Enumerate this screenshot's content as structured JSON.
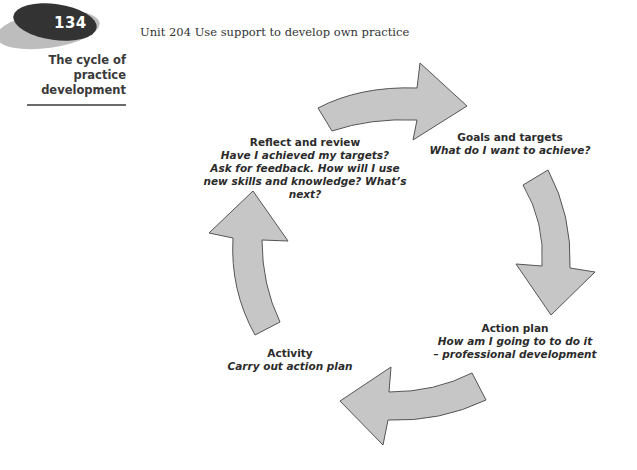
{
  "page": {
    "number": "134",
    "running_head": "Unit 204  Use support to develop own practice",
    "side_title": "The cycle of practice development"
  },
  "diagram": {
    "type": "cycle",
    "arrow_fill": "#c6c6c6",
    "arrow_stroke": "#555555",
    "stages": [
      {
        "title": "Goals and targets",
        "lines": [
          "What do I want to achieve?"
        ]
      },
      {
        "title": "Action plan",
        "lines": [
          "How am I going to to do it",
          "– professional development"
        ]
      },
      {
        "title": "Activity",
        "lines": [
          "Carry out action plan"
        ]
      },
      {
        "title": "Reflect and review",
        "lines": [
          "Have I achieved my targets?",
          "Ask for feedback. How will I use",
          "new skills and knowledge? What’s next?"
        ]
      }
    ]
  }
}
